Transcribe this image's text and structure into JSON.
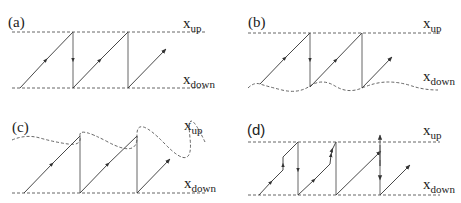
{
  "figure": {
    "panels": [
      {
        "id": "a",
        "label": "(a)",
        "upper_label": "x",
        "upper_sub": "up",
        "lower_label": "x",
        "lower_sub": "down",
        "upper_boundary": "straight",
        "lower_boundary": "straight"
      },
      {
        "id": "b",
        "label": "(b)",
        "upper_label": "x",
        "upper_sub": "up",
        "lower_label": "x",
        "lower_sub": "down",
        "upper_boundary": "straight",
        "lower_boundary": "wavy"
      },
      {
        "id": "c",
        "label": "(c)",
        "upper_label": "x",
        "upper_sub": "up",
        "lower_label": "x",
        "lower_sub": "down",
        "upper_boundary": "wavy",
        "lower_boundary": "straight"
      },
      {
        "id": "d",
        "label": "(d)",
        "upper_label": "x",
        "upper_sub": "up",
        "lower_label": "x",
        "lower_sub": "down",
        "upper_boundary": "straight",
        "lower_boundary": "straight"
      }
    ]
  }
}
